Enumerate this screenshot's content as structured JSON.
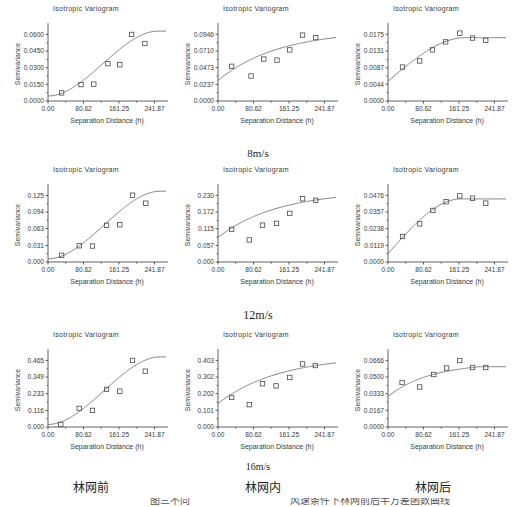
{
  "figure": {
    "panel_title": "Isotropic Variogram",
    "xlabel": "Separation Distance (h)",
    "ylabel": "Semivariance",
    "row_labels": [
      "8m/s",
      "12m/s",
      "16m/s"
    ],
    "column_labels": [
      "林网前",
      "林网内",
      "林网后"
    ],
    "bottom_caption_left": "图三不同",
    "bottom_caption_right": "风速条件下林网前后半方差函数曲线",
    "colors": {
      "axis": "#3a3a3a",
      "curve": "#6b6b6b",
      "marker": "#4a4a4a",
      "background": "#ffffff"
    }
  },
  "chart_data": [
    {
      "id": "r1c1",
      "type": "scatter",
      "title": "Isotropic Variogram",
      "xlabel": "Separation Distance (h)",
      "ylabel": "Semivariance",
      "row": "8m/s",
      "column": "林网前",
      "xticks": [
        0.0,
        80.62,
        161.25,
        241.87
      ],
      "xticklabels": [
        "0.00",
        "80.62",
        "161.25",
        "241.87"
      ],
      "yticks": [
        0.0,
        0.015,
        0.03,
        0.045,
        0.06
      ],
      "yticklabels": [
        "0.0000",
        "0.0150",
        "0.0300",
        "0.0450",
        "0.0600"
      ],
      "xlim": [
        0,
        268
      ],
      "ylim": [
        0,
        0.0667
      ],
      "points": [
        {
          "x": 31,
          "y": 0.0073
        },
        {
          "x": 75,
          "y": 0.0148
        },
        {
          "x": 104,
          "y": 0.0152
        },
        {
          "x": 136,
          "y": 0.0337
        },
        {
          "x": 163,
          "y": 0.0327
        },
        {
          "x": 190,
          "y": 0.06
        },
        {
          "x": 220,
          "y": 0.0518
        }
      ],
      "model_curve": {
        "nugget": 0.0045,
        "sill": 0.063,
        "range": 250,
        "shape": "sigmoid"
      }
    },
    {
      "id": "r1c2",
      "type": "scatter",
      "title": "Isotropic Variogram",
      "xlabel": "Separation Distance (h)",
      "ylabel": "Semivariance",
      "row": "8m/s",
      "column": "林网内",
      "xticks": [
        0.0,
        80.62,
        161.25,
        241.87
      ],
      "xticklabels": [
        "0.00",
        "80.62",
        "161.25",
        "241.87"
      ],
      "yticks": [
        0.0,
        0.0237,
        0.0473,
        0.071,
        0.0946
      ],
      "yticklabels": [
        "0.0000",
        "0.0237",
        "0.0473",
        "0.0710",
        "0.0946"
      ],
      "xlim": [
        0,
        268
      ],
      "ylim": [
        0,
        0.105
      ],
      "points": [
        {
          "x": 31,
          "y": 0.0492
        },
        {
          "x": 75,
          "y": 0.0355
        },
        {
          "x": 104,
          "y": 0.0595
        },
        {
          "x": 134,
          "y": 0.058
        },
        {
          "x": 163,
          "y": 0.0725
        },
        {
          "x": 192,
          "y": 0.0935
        },
        {
          "x": 222,
          "y": 0.09
        }
      ],
      "model_curve": {
        "nugget": 0.029,
        "sill": 0.1,
        "range": 300,
        "shape": "concave"
      }
    },
    {
      "id": "r1c3",
      "type": "scatter",
      "title": "Isotropic Variogram",
      "xlabel": "Separation Distance (h)",
      "ylabel": "Semivariance",
      "row": "8m/s",
      "column": "林网后",
      "xticks": [
        0.0,
        80.62,
        161.25,
        241.87
      ],
      "xticklabels": [
        "0.00",
        "80.62",
        "161.25",
        "241.87"
      ],
      "yticks": [
        0.0,
        0.0044,
        0.0087,
        0.0131,
        0.0175
      ],
      "yticklabels": [
        "0.0000",
        "0.0044",
        "0.0087",
        "0.0131",
        "0.0175"
      ],
      "xlim": [
        0,
        268
      ],
      "ylim": [
        0,
        0.0194
      ],
      "points": [
        {
          "x": 33,
          "y": 0.0089
        },
        {
          "x": 72,
          "y": 0.0105
        },
        {
          "x": 101,
          "y": 0.0134
        },
        {
          "x": 131,
          "y": 0.0155
        },
        {
          "x": 163,
          "y": 0.0178
        },
        {
          "x": 192,
          "y": 0.0165
        },
        {
          "x": 222,
          "y": 0.0159
        }
      ],
      "model_curve": {
        "nugget": 0.0052,
        "sill": 0.0166,
        "range": 175,
        "shape": "spherical"
      }
    },
    {
      "id": "r2c1",
      "type": "scatter",
      "title": "Isotropic Variogram",
      "xlabel": "Separation Distance (h)",
      "ylabel": "Semivariance",
      "row": "12m/s",
      "column": "林网前",
      "xticks": [
        0.0,
        80.62,
        161.25,
        241.87
      ],
      "xticklabels": [
        "0.00",
        "80.62",
        "161.25",
        "241.87"
      ],
      "yticks": [
        0.0,
        0.031,
        0.063,
        0.094,
        0.125
      ],
      "yticklabels": [
        "0.000",
        "0.031",
        "0.063",
        "0.094",
        "0.125"
      ],
      "xlim": [
        0,
        268
      ],
      "ylim": [
        0,
        0.139
      ],
      "points": [
        {
          "x": 31,
          "y": 0.0125
        },
        {
          "x": 71,
          "y": 0.0305
        },
        {
          "x": 101,
          "y": 0.03
        },
        {
          "x": 133,
          "y": 0.069
        },
        {
          "x": 163,
          "y": 0.07
        },
        {
          "x": 192,
          "y": 0.1255
        },
        {
          "x": 222,
          "y": 0.1105
        }
      ],
      "model_curve": {
        "nugget": 0.006,
        "sill": 0.133,
        "range": 255,
        "shape": "sigmoid"
      }
    },
    {
      "id": "r2c2",
      "type": "scatter",
      "title": "Isotropic Variogram",
      "xlabel": "Separation Distance (h)",
      "ylabel": "Semivariance",
      "row": "12m/s",
      "column": "林网内",
      "xticks": [
        0.0,
        80.62,
        161.25,
        241.87
      ],
      "xticklabels": [
        "0.00",
        "80.62",
        "161.25",
        "241.87"
      ],
      "yticks": [
        0.0,
        0.057,
        0.115,
        0.172,
        0.23
      ],
      "yticklabels": [
        "0.000",
        "0.057",
        "0.115",
        "0.172",
        "0.230"
      ],
      "xlim": [
        0,
        268
      ],
      "ylim": [
        0,
        0.255
      ],
      "points": [
        {
          "x": 31,
          "y": 0.1125
        },
        {
          "x": 71,
          "y": 0.076
        },
        {
          "x": 101,
          "y": 0.127
        },
        {
          "x": 133,
          "y": 0.133
        },
        {
          "x": 163,
          "y": 0.1675
        },
        {
          "x": 192,
          "y": 0.218
        },
        {
          "x": 222,
          "y": 0.2125
        }
      ],
      "model_curve": {
        "nugget": 0.085,
        "sill": 0.245,
        "range": 300,
        "shape": "concave"
      }
    },
    {
      "id": "r2c3",
      "type": "scatter",
      "title": "Isotropic Variogram",
      "xlabel": "Separation Distance (h)",
      "ylabel": "Semivariance",
      "row": "12m/s",
      "column": "林网后",
      "xticks": [
        0.0,
        80.62,
        161.25,
        241.87
      ],
      "xticklabels": [
        "0.00",
        "80.62",
        "161.25",
        "241.87"
      ],
      "yticks": [
        0.0,
        0.0119,
        0.0238,
        0.0357,
        0.0476
      ],
      "yticklabels": [
        "0.0000",
        "0.0119",
        "0.0238",
        "0.0357",
        "0.0476"
      ],
      "xlim": [
        0,
        268
      ],
      "ylim": [
        0,
        0.0528
      ],
      "points": [
        {
          "x": 33,
          "y": 0.0182
        },
        {
          "x": 72,
          "y": 0.0272
        },
        {
          "x": 102,
          "y": 0.0368
        },
        {
          "x": 132,
          "y": 0.043
        },
        {
          "x": 163,
          "y": 0.0472
        },
        {
          "x": 192,
          "y": 0.0455
        },
        {
          "x": 222,
          "y": 0.042
        }
      ],
      "model_curve": {
        "nugget": 0.006,
        "sill": 0.045,
        "range": 165,
        "shape": "spherical"
      }
    },
    {
      "id": "r3c1",
      "type": "scatter",
      "title": "Isotropic Variogram",
      "xlabel": "Separation Distance (h)",
      "ylabel": "Semivariance",
      "row": "16m/s",
      "column": "林网前",
      "xticks": [
        0.0,
        80.62,
        161.25,
        241.87
      ],
      "xticklabels": [
        "0.00",
        "80.62",
        "161.25",
        "241.87"
      ],
      "yticks": [
        0.0,
        0.116,
        0.233,
        0.349,
        0.465
      ],
      "yticklabels": [
        "0.000",
        "0.116",
        "0.233",
        "0.349",
        "0.465"
      ],
      "xlim": [
        0,
        268
      ],
      "ylim": [
        0,
        0.517
      ],
      "points": [
        {
          "x": 29,
          "y": 0.018
        },
        {
          "x": 71,
          "y": 0.13
        },
        {
          "x": 101,
          "y": 0.116
        },
        {
          "x": 133,
          "y": 0.263
        },
        {
          "x": 163,
          "y": 0.25
        },
        {
          "x": 192,
          "y": 0.465
        },
        {
          "x": 221,
          "y": 0.39
        }
      ],
      "model_curve": {
        "nugget": 0.018,
        "sill": 0.49,
        "range": 255,
        "shape": "sigmoid"
      }
    },
    {
      "id": "r3c2",
      "type": "scatter",
      "title": "Isotropic Variogram",
      "xlabel": "Separation Distance (h)",
      "ylabel": "Semivariance",
      "row": "16m/s",
      "column": "林网内",
      "xticks": [
        0.0,
        80.62,
        161.25,
        241.87
      ],
      "xticklabels": [
        "0.00",
        "80.62",
        "161.25",
        "241.87"
      ],
      "yticks": [
        0.0,
        0.101,
        0.202,
        0.302,
        0.403
      ],
      "yticklabels": [
        "0.000",
        "0.101",
        "0.202",
        "0.302",
        "0.403"
      ],
      "xlim": [
        0,
        268
      ],
      "ylim": [
        0,
        0.448
      ],
      "points": [
        {
          "x": 31,
          "y": 0.179
        },
        {
          "x": 71,
          "y": 0.135
        },
        {
          "x": 101,
          "y": 0.262
        },
        {
          "x": 132,
          "y": 0.249
        },
        {
          "x": 163,
          "y": 0.3
        },
        {
          "x": 192,
          "y": 0.382
        },
        {
          "x": 221,
          "y": 0.372
        }
      ],
      "model_curve": {
        "nugget": 0.142,
        "sill": 0.43,
        "range": 305,
        "shape": "concave"
      }
    },
    {
      "id": "r3c3",
      "type": "scatter",
      "title": "Isotropic Variogram",
      "xlabel": "Separation Distance (h)",
      "ylabel": "Semivariance",
      "row": "16m/s",
      "column": "林网后",
      "xticks": [
        0.0,
        80.62,
        161.25,
        241.87
      ],
      "xticklabels": [
        "0.00",
        "80.62",
        "161.25",
        "241.87"
      ],
      "yticks": [
        0.0,
        0.0167,
        0.0333,
        0.05,
        0.0666
      ],
      "yticklabels": [
        "0.0000",
        "0.0167",
        "0.0333",
        "0.0500",
        "0.0666"
      ],
      "xlim": [
        0,
        268
      ],
      "ylim": [
        0,
        0.074
      ],
      "points": [
        {
          "x": 32,
          "y": 0.0445
        },
        {
          "x": 72,
          "y": 0.04
        },
        {
          "x": 104,
          "y": 0.0525
        },
        {
          "x": 133,
          "y": 0.059
        },
        {
          "x": 163,
          "y": 0.0665
        },
        {
          "x": 192,
          "y": 0.0595
        },
        {
          "x": 222,
          "y": 0.0595
        }
      ],
      "model_curve": {
        "nugget": 0.0305,
        "sill": 0.064,
        "range": 210,
        "shape": "concave"
      }
    }
  ]
}
